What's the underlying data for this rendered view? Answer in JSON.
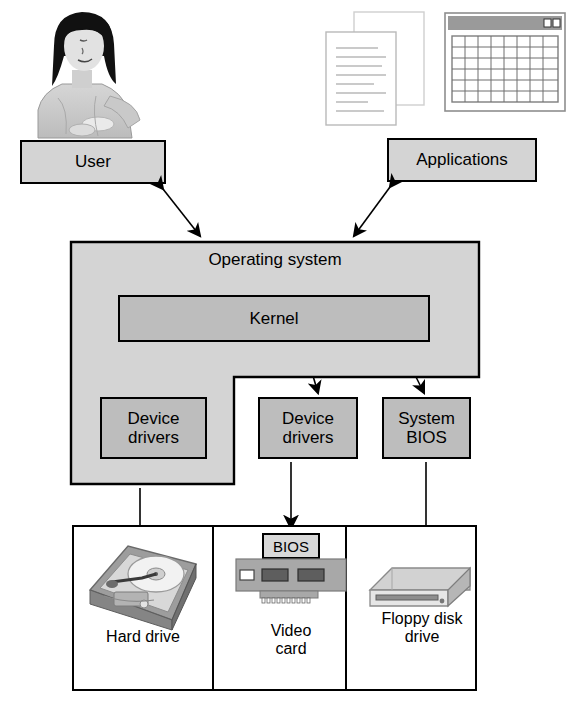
{
  "diagram": {
    "nodes": {
      "user": "User",
      "applications": "Applications",
      "operating_system": "Operating system",
      "kernel": "Kernel",
      "device_drivers_left": "Device\ndrivers",
      "device_drivers_mid": "Device\ndrivers",
      "system_bios": "System\nBIOS",
      "bios_chip": "BIOS"
    },
    "hardware": {
      "items": [
        {
          "label": "Hard drive",
          "icon": "hard-drive-icon"
        },
        {
          "label": "Video\ncard",
          "icon": "video-card-icon"
        },
        {
          "label": "Floppy disk\ndrive",
          "icon": "floppy-drive-icon"
        }
      ]
    },
    "illustrations": [
      {
        "name": "user-photo-icon",
        "caption": ""
      },
      {
        "name": "documents-icon",
        "caption": ""
      },
      {
        "name": "spreadsheet-window-icon",
        "caption": ""
      }
    ],
    "connections": [
      {
        "from": "User",
        "to": "Operating system",
        "style": "double-arrow"
      },
      {
        "from": "Applications",
        "to": "Operating system",
        "style": "double-arrow"
      },
      {
        "from": "Kernel",
        "to": "Device drivers",
        "style": "double-arrow"
      },
      {
        "from": "Kernel",
        "to": "Device drivers",
        "style": "double-arrow"
      },
      {
        "from": "Kernel",
        "to": "System BIOS",
        "style": "double-arrow"
      },
      {
        "from": "Device drivers",
        "to": "Hard drive",
        "style": "single-arrow"
      },
      {
        "from": "Device drivers",
        "to": "Video card",
        "style": "single-arrow"
      },
      {
        "from": "System BIOS",
        "to": "Floppy disk drive",
        "style": "single-arrow"
      }
    ],
    "colors": {
      "os_fill": "#d4d4d4",
      "kernel_fill": "#bdbdbd",
      "driver_fill": "#bdbdbd",
      "box_fill": "#d4d4d4",
      "stroke": "#000000",
      "page": "#ffffff"
    }
  }
}
